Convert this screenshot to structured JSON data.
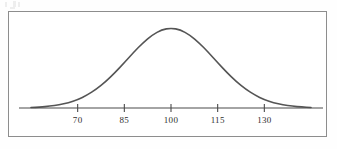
{
  "figure": {
    "background_color": "#fefefe",
    "frame_color": "#8d8d8d",
    "frame_background": "#ffffff"
  },
  "chart_data": {
    "type": "line",
    "title": "",
    "subtitle": "",
    "xlabel": "",
    "ylabel": "",
    "curve": "normal distribution bell curve",
    "mean": 100,
    "std_dev": 15,
    "grid": false,
    "legend": null,
    "legend_position": "none",
    "axis_line_color": "#4a4a4a",
    "curve_color": "#555555",
    "curve_width": 1.6,
    "xlim": [
      55,
      145
    ],
    "ylim": [
      0,
      1
    ],
    "tick_labels": [
      "70",
      "85",
      "100",
      "115",
      "130"
    ],
    "tick_values": [
      70,
      85,
      100,
      115,
      130
    ],
    "x": [
      55,
      58,
      61,
      64,
      67,
      70,
      73,
      76,
      79,
      82,
      85,
      88,
      91,
      94,
      97,
      100,
      103,
      106,
      109,
      112,
      115,
      118,
      121,
      124,
      127,
      130,
      133,
      136,
      139,
      142,
      145
    ],
    "y": [
      0.0033,
      0.0063,
      0.0116,
      0.0203,
      0.034,
      0.0546,
      0.0837,
      0.1228,
      0.1723,
      0.2311,
      0.2963,
      0.3632,
      0.4258,
      0.4771,
      0.5105,
      0.5222,
      0.5105,
      0.4771,
      0.4258,
      0.3632,
      0.2963,
      0.2311,
      0.1723,
      0.1228,
      0.0837,
      0.0546,
      0.034,
      0.0203,
      0.0116,
      0.0063,
      0.0033
    ]
  },
  "axis": {
    "tick_marks": [
      {
        "label": "70",
        "value": 70
      },
      {
        "label": "85",
        "value": 85
      },
      {
        "label": "100",
        "value": 100
      },
      {
        "label": "115",
        "value": 115
      },
      {
        "label": "130",
        "value": 130
      }
    ]
  }
}
